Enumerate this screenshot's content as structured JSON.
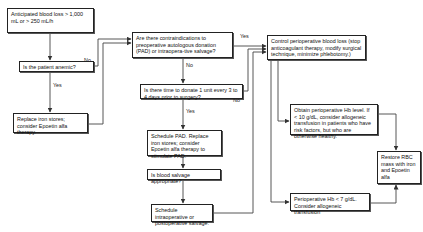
{
  "diagram": {
    "type": "flowchart",
    "nodes": {
      "start": "Anticipated blood loss > 1,000 mL or > 250 mL/h",
      "anemic": "Is the patient anemic?",
      "replace_iron": "Replace iron stores; consider Epoetin alfa therapy.",
      "contraindications": "Are there contraindications to preoperative autologous donation (PAD) or intraopera-tive salvage?",
      "time_to_donate": "Is there time to donate 1 unit every 3 to 4 days prior to surgery?",
      "schedule_pad": "Schedule PAD. Replace iron stores; consider Epoetin alfa therapy to stimulate PAD.",
      "salvage_appropriate": "Is blood salvage appropriate?",
      "schedule_salvage": "Schedule intraoperative or postoperative salvage.",
      "control_loss": "Control perioperative blood loss (stop anticoagulant therapy, modify surgical technique, minimize phlebotomy.)",
      "obtain_hb": "Obtain perioperative Hb level. If < 10 g/dL, consider allogeneic transfusion in patients who have risk factors, but who are otherwise healthy.",
      "hb_under_7": "Perioperative Hb < 7 g/dL. Consider allogeneic transfusion",
      "restore_rbc": "Restore RBC mass with iron and Epoetin alfa"
    },
    "edge_labels": {
      "anemic_no": "No",
      "anemic_yes": "Yes",
      "contra_yes": "Yes",
      "contra_no": "No",
      "time_yes": "Yes",
      "time_no": "No"
    }
  }
}
